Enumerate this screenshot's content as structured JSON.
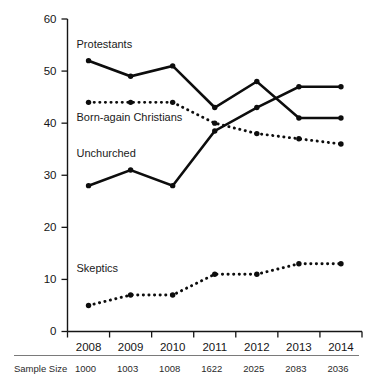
{
  "chart_data": {
    "type": "line",
    "title": "",
    "xlabel": "",
    "ylabel": "",
    "categories": [
      "2008",
      "2009",
      "2010",
      "2011",
      "2012",
      "2013",
      "2014"
    ],
    "ylim": [
      0,
      60
    ],
    "yticks": [
      0,
      10,
      20,
      30,
      40,
      50,
      60
    ],
    "ytick_labels": [
      "0",
      "10",
      "20",
      "30",
      "40",
      "50",
      "60"
    ],
    "grid": false,
    "legend_position": "inline-labels",
    "series": [
      {
        "name": "Protestants",
        "style": "solid",
        "values": [
          52,
          49,
          51,
          43,
          48,
          41,
          41
        ]
      },
      {
        "name": "Born-again Christians",
        "style": "dotted",
        "values": [
          44,
          44,
          44,
          40,
          38,
          37,
          36
        ]
      },
      {
        "name": "Unchurched",
        "style": "solid",
        "values": [
          28,
          31,
          28,
          38.5,
          43,
          47,
          47
        ]
      },
      {
        "name": "Skeptics",
        "style": "dotted",
        "values": [
          5,
          7,
          7,
          11,
          11,
          13,
          13
        ]
      }
    ],
    "annotations": [
      {
        "text": "Protestants",
        "x": 2008,
        "y": 54.5
      },
      {
        "text": "Born-again Christians",
        "x": 2008,
        "y": 40.5
      },
      {
        "text": "Unchurched",
        "x": 2008,
        "y": 33.5
      },
      {
        "text": "Skeptics",
        "x": 2008,
        "y": 11.5
      }
    ],
    "footer": {
      "label": "Sample Size",
      "values": [
        "1000",
        "1003",
        "1008",
        "1622",
        "2025",
        "2083",
        "2036"
      ]
    },
    "colors": {
      "line": "#0d0d0d",
      "axis": "#151515",
      "text": "#1a1a1a",
      "rule": "#7a7a7a",
      "background": "#ffffff"
    }
  }
}
